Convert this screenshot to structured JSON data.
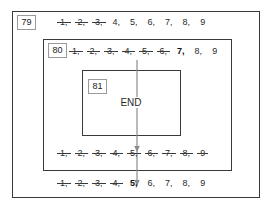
{
  "diagram": {
    "outer_border_color": "#3a3a3a",
    "background_color": "#ffffff",
    "end_label": "END",
    "boxes": [
      {
        "id": "79",
        "label": "79"
      },
      {
        "id": "80",
        "label": "80"
      },
      {
        "id": "81",
        "label": "81"
      }
    ],
    "sequences": [
      {
        "id": "seq-0",
        "scope": "79",
        "tokens": [
          {
            "text": "1",
            "struck": true,
            "bold": false
          },
          {
            "text": "2",
            "struck": true,
            "bold": false
          },
          {
            "text": "3",
            "struck": true,
            "bold": false
          },
          {
            "text": "4",
            "struck": false,
            "bold": false
          },
          {
            "text": "5",
            "struck": false,
            "bold": false
          },
          {
            "text": "6",
            "struck": false,
            "bold": false
          },
          {
            "text": "7",
            "struck": false,
            "bold": false
          },
          {
            "text": "8",
            "struck": false,
            "bold": false
          },
          {
            "text": "9",
            "struck": false,
            "bold": false
          }
        ]
      },
      {
        "id": "seq-1",
        "scope": "80",
        "tokens": [
          {
            "text": "1",
            "struck": true,
            "bold": false
          },
          {
            "text": "2",
            "struck": true,
            "bold": false
          },
          {
            "text": "3",
            "struck": true,
            "bold": false
          },
          {
            "text": "4",
            "struck": true,
            "bold": false
          },
          {
            "text": "5",
            "struck": true,
            "bold": false
          },
          {
            "text": "6",
            "struck": true,
            "bold": false
          },
          {
            "text": "7",
            "struck": false,
            "bold": true
          },
          {
            "text": "8",
            "struck": false,
            "bold": false
          },
          {
            "text": "9",
            "struck": false,
            "bold": false
          }
        ]
      },
      {
        "id": "seq-2",
        "scope": "80",
        "tokens": [
          {
            "text": "1",
            "struck": true,
            "bold": false
          },
          {
            "text": "2",
            "struck": true,
            "bold": false
          },
          {
            "text": "3",
            "struck": true,
            "bold": false
          },
          {
            "text": "4",
            "struck": true,
            "bold": false
          },
          {
            "text": "5",
            "struck": true,
            "bold": false
          },
          {
            "text": "6",
            "struck": true,
            "bold": false
          },
          {
            "text": "7",
            "struck": true,
            "bold": false
          },
          {
            "text": "8",
            "struck": true,
            "bold": false
          },
          {
            "text": "9",
            "struck": true,
            "bold": false
          }
        ]
      },
      {
        "id": "seq-3",
        "scope": "79",
        "tokens": [
          {
            "text": "1",
            "struck": true,
            "bold": false
          },
          {
            "text": "2",
            "struck": true,
            "bold": false
          },
          {
            "text": "3",
            "struck": true,
            "bold": false
          },
          {
            "text": "4",
            "struck": true,
            "bold": false
          },
          {
            "text": "5",
            "struck": false,
            "bold": true
          },
          {
            "text": "6",
            "struck": false,
            "bold": false
          },
          {
            "text": "7",
            "struck": false,
            "bold": false
          },
          {
            "text": "8",
            "struck": false,
            "bold": false
          },
          {
            "text": "9",
            "struck": false,
            "bold": false
          }
        ]
      }
    ],
    "flow_arrow": {
      "name": "downward-flow-arrow",
      "color": "#8c8c8c"
    }
  }
}
